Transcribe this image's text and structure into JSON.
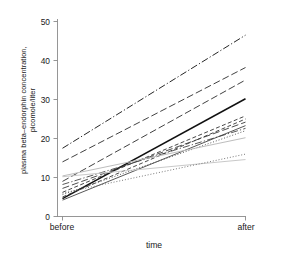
{
  "chart_data": {
    "type": "line",
    "title": "",
    "xlabel": "time",
    "ylabel": "plasma beta-endorphin concentration, picomole/liter",
    "ylabel_line1": "plasma beta–endorphin concentration,",
    "ylabel_line2": "picomole/liter",
    "categories": [
      "before",
      "after"
    ],
    "x": [
      0,
      1
    ],
    "ylim": [
      0,
      52
    ],
    "yticks": [
      0,
      10,
      20,
      30,
      40,
      50
    ],
    "ytick_labels": [
      "0",
      "10",
      "20",
      "30",
      "40",
      "50"
    ],
    "grid": false,
    "legend": "none",
    "series": [
      {
        "name": "subject-1",
        "values": [
          17.5,
          46.5
        ],
        "style": "dashdot",
        "color": "#1a1a1a",
        "width": 0.95
      },
      {
        "name": "subject-2",
        "values": [
          14.0,
          38.2
        ],
        "style": "dashed-long",
        "color": "#2b2b2b",
        "width": 0.9
      },
      {
        "name": "subject-3",
        "values": [
          9.0,
          35.0
        ],
        "style": "dashed-long",
        "color": "#2b2b2b",
        "width": 0.9
      },
      {
        "name": "subject-4",
        "values": [
          4.6,
          30.2
        ],
        "style": "solid",
        "color": "#111111",
        "width": 1.5
      },
      {
        "name": "subject-5",
        "values": [
          6.2,
          25.8
        ],
        "style": "dashed",
        "color": "#333333",
        "width": 0.9
      },
      {
        "name": "subject-6",
        "values": [
          5.0,
          25.0
        ],
        "style": "dashed",
        "color": "#333333",
        "width": 0.9
      },
      {
        "name": "subject-7",
        "values": [
          7.2,
          24.2
        ],
        "style": "dashed-long",
        "color": "#3a3a3a",
        "width": 0.9
      },
      {
        "name": "subject-8",
        "values": [
          4.2,
          23.3
        ],
        "style": "solid",
        "color": "#444444",
        "width": 0.9
      },
      {
        "name": "subject-9",
        "values": [
          8.2,
          22.6
        ],
        "style": "dashdot",
        "color": "#3a3a3a",
        "width": 0.85
      },
      {
        "name": "subject-10",
        "values": [
          5.6,
          22.0
        ],
        "style": "dotted",
        "color": "#4a4a4a",
        "width": 0.9
      },
      {
        "name": "subject-11",
        "values": [
          10.4,
          20.2
        ],
        "style": "solid",
        "color": "#bdbdbd",
        "width": 1.0
      },
      {
        "name": "subject-12",
        "values": [
          10.2,
          14.6
        ],
        "style": "solid",
        "color": "#c9c9c9",
        "width": 1.0
      },
      {
        "name": "subject-13",
        "values": [
          6.0,
          16.0
        ],
        "style": "dotted",
        "color": "#6a6a6a",
        "width": 0.9
      }
    ]
  },
  "axes": {
    "y_tick_0": "0",
    "y_tick_10": "10",
    "y_tick_20": "20",
    "y_tick_30": "30",
    "y_tick_40": "40",
    "y_tick_50": "50",
    "x_cat_before": "before",
    "x_cat_after": "after",
    "x_axis_title": "time"
  }
}
